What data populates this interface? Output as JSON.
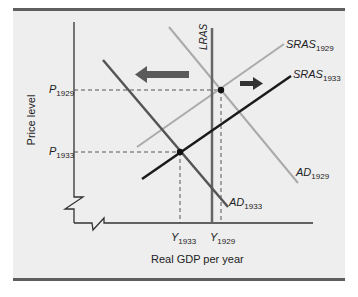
{
  "figure": {
    "x_axis_title": "Real GDP per year",
    "y_axis_title": "Price level",
    "y_ticks": [
      {
        "main": "P",
        "sub": "1929"
      },
      {
        "main": "P",
        "sub": "1933"
      }
    ],
    "x_ticks": [
      {
        "main": "Y",
        "sub": "1933"
      },
      {
        "main": "Y",
        "sub": "1929"
      }
    ],
    "curves": {
      "lras": {
        "label": "LRAS",
        "color": "#666666"
      },
      "sras_1929": {
        "main": "SRAS",
        "sub": "1929",
        "color": "#aaaaaa"
      },
      "sras_1933": {
        "main": "SRAS",
        "sub": "1933",
        "color": "#1a1a1a"
      },
      "ad_1929": {
        "main": "AD",
        "sub": "1929",
        "color": "#aaaaaa"
      },
      "ad_1933": {
        "main": "AD",
        "sub": "1933",
        "color": "#555555"
      }
    },
    "arrows": [
      {
        "direction": "left",
        "meaning": "AD shifts left",
        "color": "#5a5a5a"
      },
      {
        "direction": "right",
        "meaning": "SRAS shifts right",
        "color": "#333333"
      }
    ],
    "equilibria": [
      {
        "name": "1929",
        "price": "P1929",
        "output": "Y1929"
      },
      {
        "name": "1933",
        "price": "P1933",
        "output": "Y1933"
      }
    ]
  }
}
